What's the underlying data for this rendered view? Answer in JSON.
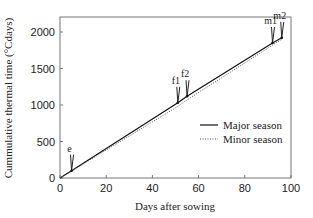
{
  "chart_data": {
    "type": "line",
    "title": "",
    "xlabel": "Days after sowing",
    "ylabel": "Cummulative thermal time (°Cdays)",
    "xlim": [
      0,
      100
    ],
    "ylim": [
      0,
      2200
    ],
    "xticks": [
      0,
      20,
      40,
      60,
      80,
      100
    ],
    "yticks": [
      0,
      500,
      1000,
      1500,
      2000
    ],
    "grid": false,
    "legend_position": "lower right",
    "series": [
      {
        "name": "Major season",
        "style": "solid",
        "x": [
          0,
          5,
          51,
          55,
          92,
          96
        ],
        "y": [
          0,
          100,
          1030,
          1120,
          1850,
          1920
        ]
      },
      {
        "name": "Minor season",
        "style": "dotted",
        "x": [
          0,
          5,
          51,
          55,
          92,
          96
        ],
        "y": [
          0,
          95,
          980,
          1070,
          1820,
          1900
        ]
      }
    ],
    "annotations": [
      {
        "label": "e",
        "x": 5,
        "y": 100
      },
      {
        "label": "f1",
        "x": 51,
        "y": 1030
      },
      {
        "label": "f2",
        "x": 55,
        "y": 1120
      },
      {
        "label": "m1",
        "x": 92,
        "y": 1850
      },
      {
        "label": "m2",
        "x": 96,
        "y": 1920
      }
    ]
  }
}
